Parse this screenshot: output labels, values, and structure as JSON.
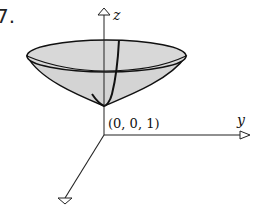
{
  "figure": {
    "number": "7.",
    "axes": {
      "x": "x",
      "y": "y",
      "z": "z"
    },
    "point_label": "(0, 0, 1)",
    "surface": "paraboloid opening upward with vertex at (0, 0, 1)",
    "colors": {
      "surface_fill": "#d4d4d4",
      "stroke": "#111111"
    }
  }
}
